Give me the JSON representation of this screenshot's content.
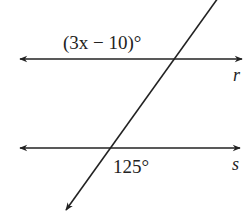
{
  "diagram": {
    "type": "parallel-lines-cut-by-transversal",
    "lines": [
      {
        "name": "r",
        "label": "r",
        "y": 59
      },
      {
        "name": "s",
        "label": "s",
        "y": 148
      }
    ],
    "transversal": {
      "label": ""
    },
    "angles": [
      {
        "line": "r",
        "position": "upper-left",
        "label": "(3x − 10)°"
      },
      {
        "line": "s",
        "position": "lower-right",
        "label": "125°"
      }
    ],
    "colors": {
      "stroke": "#222222",
      "background": "#ffffff"
    }
  }
}
